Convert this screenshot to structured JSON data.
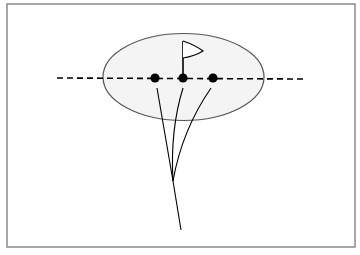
{
  "figure": {
    "colors": {
      "background": "#ffffff",
      "frame": "#8a8a8a",
      "green_fill": "#f4f4f4",
      "green_stroke": "#555555",
      "ink": "#000000"
    },
    "frame": {
      "x": 7,
      "y": 4,
      "w": 348,
      "h": 243
    },
    "green": {
      "cx": 183.5,
      "cy": 77,
      "rx": 80.5,
      "ry": 43.5,
      "label": "green"
    },
    "aim_line": {
      "x1": 57,
      "y1": 78,
      "x2": 303,
      "y2": 79,
      "style": "dashed"
    },
    "flag": {
      "pole_x": 183,
      "pole_top": 41,
      "pole_bottom": 78,
      "label": "flagstick"
    },
    "balls": [
      {
        "x": 155,
        "y": 78,
        "label": "ball-left"
      },
      {
        "x": 183,
        "y": 78,
        "label": "ball-center"
      },
      {
        "x": 213,
        "y": 78,
        "label": "ball-right"
      }
    ],
    "trajectories": [
      {
        "label": "path-left",
        "d": "M173 181 L157 88"
      },
      {
        "label": "path-center",
        "d": "M173 181 Q170 130 183 88"
      },
      {
        "label": "path-right",
        "d": "M173 181 Q182 130 211 88"
      },
      {
        "label": "path-stem",
        "d": "M173 181 L181 230"
      }
    ]
  }
}
